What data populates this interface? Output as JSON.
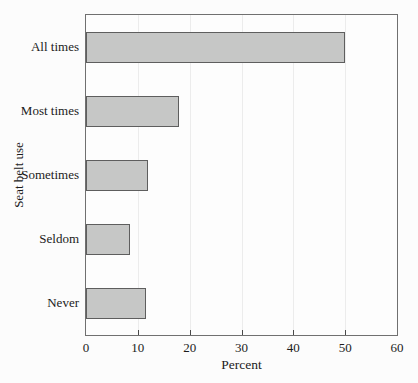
{
  "page": {
    "background": "#fcfcfc"
  },
  "chart_data": {
    "type": "bar",
    "orientation": "horizontal",
    "title": "",
    "categories": [
      "All times",
      "Most times",
      "Sometimes",
      "Seldom",
      "Never"
    ],
    "values": [
      50,
      18,
      12,
      8.5,
      11.5
    ],
    "xlabel": "Percent",
    "ylabel": "Seat belt use",
    "xlim": [
      0,
      60
    ],
    "xticks": [
      0,
      10,
      20,
      30,
      40,
      50,
      60
    ],
    "grid": "vertical gridlines at each x tick",
    "legend": "none",
    "colors": {
      "bar_fill": "#c6c7c6",
      "bar_border": "#5e5e5e",
      "plot_border": "#707070",
      "gridline": "#ececec",
      "tick": "#4a4a4a",
      "text": "#1b1b1b"
    }
  }
}
